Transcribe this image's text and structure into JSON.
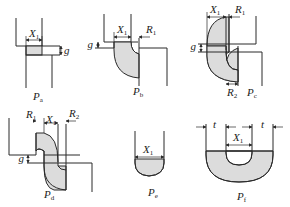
{
  "figure": {
    "panels": [
      {
        "id": "a",
        "caption": "P",
        "caption_sub": "a",
        "labels": [
          {
            "text": "X",
            "sub": "1"
          },
          {
            "text": "g",
            "sub": ""
          }
        ]
      },
      {
        "id": "b",
        "caption": "P",
        "caption_sub": "b",
        "labels": [
          {
            "text": "X",
            "sub": "1"
          },
          {
            "text": "R",
            "sub": "1"
          },
          {
            "text": "g",
            "sub": ""
          }
        ]
      },
      {
        "id": "c",
        "caption": "P",
        "caption_sub": "c",
        "labels": [
          {
            "text": "X",
            "sub": "1"
          },
          {
            "text": "R",
            "sub": "1"
          },
          {
            "text": "R",
            "sub": "2"
          },
          {
            "text": "g",
            "sub": ""
          }
        ]
      },
      {
        "id": "d",
        "caption": "P",
        "caption_sub": "d",
        "labels": [
          {
            "text": "R",
            "sub": "1"
          },
          {
            "text": "X",
            "sub": "1"
          },
          {
            "text": "R",
            "sub": "2"
          },
          {
            "text": "g",
            "sub": ""
          }
        ]
      },
      {
        "id": "e",
        "caption": "P",
        "caption_sub": "e",
        "labels": [
          {
            "text": "X",
            "sub": "1"
          }
        ]
      },
      {
        "id": "f",
        "caption": "P",
        "caption_sub": "f",
        "labels": [
          {
            "text": "t",
            "sub": ""
          },
          {
            "text": "X",
            "sub": "1"
          },
          {
            "text": "t",
            "sub": ""
          }
        ]
      }
    ],
    "colors": {
      "stroke": "#2a2a2a",
      "shade": "#dcdcdc",
      "background": "#ffffff"
    }
  }
}
